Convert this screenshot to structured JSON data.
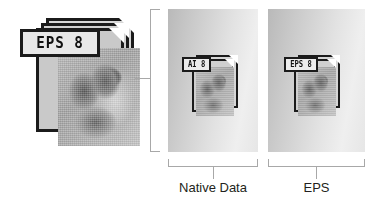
{
  "diagram": {
    "source_icon": {
      "name": "eps-file-icon-large",
      "tag_label": "EPS 8",
      "description": "stacked EPS document icon with photo thumbnail"
    },
    "connector": {
      "left_bracket": "vertical-bracket",
      "left_tick": "tick-mark"
    },
    "panels": [
      {
        "id": "native",
        "icon_tag_label": "AI 8",
        "caption": "Native Data",
        "bracket": "bottom-bracket",
        "tick": "bottom-tick"
      },
      {
        "id": "eps",
        "icon_tag_label": "EPS 8",
        "caption": "EPS",
        "bracket": "bottom-bracket",
        "tick": "bottom-tick"
      }
    ],
    "colors": {
      "icon_outline": "#1b1b1b",
      "tag_fill": "#e8e8e8",
      "bracket_line": "#a8a8a8",
      "caption_text": "#231f20",
      "panel_gradient_start": "#b9b9b9",
      "panel_gradient_end": "#efefef",
      "background": "#ffffff"
    }
  }
}
